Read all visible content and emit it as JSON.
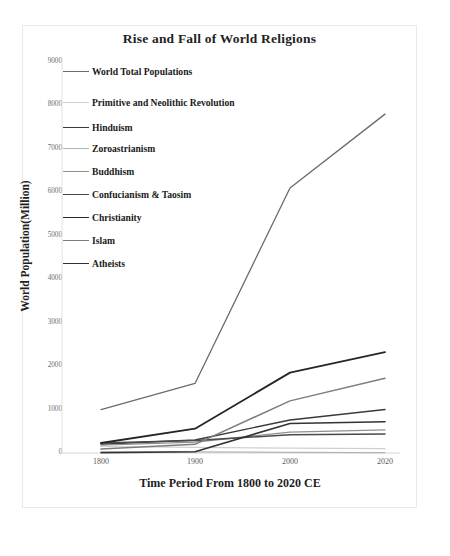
{
  "chart_data": {
    "type": "line",
    "title": "Rise and Fall of World Religions",
    "xlabel": "Time Period From 1800 to 2020 CE",
    "ylabel": "World Population(Million)",
    "categories": [
      "1800",
      "1900",
      "2000",
      "2020"
    ],
    "x": [
      1800,
      1900,
      2000,
      2020
    ],
    "xlim": [
      1790,
      2030
    ],
    "ylim": [
      0,
      9000
    ],
    "yticks": [
      0,
      1000,
      2000,
      3000,
      4000,
      5000,
      6000,
      7000,
      8000,
      9000
    ],
    "ytick_labels": [
      "0",
      "1000",
      "2000",
      "3000",
      "4000",
      "5000",
      "6000",
      "7000",
      "8000",
      "9000"
    ],
    "grid": false,
    "legend_position": "upper-left-inside",
    "series": [
      {
        "name": "World Total Populations",
        "color": "#6b6b6b",
        "width": 1.3,
        "values": [
          1000,
          1600,
          6100,
          7800
        ]
      },
      {
        "name": "Primitive and Neolithic Revolution",
        "color": "#d0d0d0",
        "width": 1.2,
        "values": [
          150,
          130,
          110,
          100
        ]
      },
      {
        "name": "Hinduism",
        "color": "#3a3a3a",
        "width": 1.4,
        "values": [
          200,
          300,
          760,
          1000
        ]
      },
      {
        "name": "Zoroastrianism",
        "color": "#b4b4b4",
        "width": 1.2,
        "values": [
          30,
          25,
          15,
          10
        ]
      },
      {
        "name": "Buddhism",
        "color": "#8f8f8f",
        "width": 1.3,
        "values": [
          180,
          250,
          480,
          530
        ]
      },
      {
        "name": "Confucianism & Taosim",
        "color": "#4a4a4a",
        "width": 1.5,
        "values": [
          230,
          290,
          420,
          440
        ]
      },
      {
        "name": "Christianity",
        "color": "#262626",
        "width": 1.8,
        "values": [
          230,
          560,
          1850,
          2320
        ]
      },
      {
        "name": "Islam",
        "color": "#7d7d7d",
        "width": 1.5,
        "values": [
          90,
          200,
          1200,
          1720
        ]
      },
      {
        "name": "Atheists",
        "color": "#333333",
        "width": 1.6,
        "values": [
          5,
          30,
          680,
          720
        ]
      }
    ]
  },
  "legend": {
    "items": [
      {
        "label": "World Total Populations"
      },
      {
        "label": "Primitive and Neolithic Revolution"
      },
      {
        "label": "Hinduism"
      },
      {
        "label": "Zoroastrianism"
      },
      {
        "label": "Buddhism"
      },
      {
        "label": "Confucianism & Taosim"
      },
      {
        "label": "Christianity"
      },
      {
        "label": "Islam"
      },
      {
        "label": "Atheists"
      }
    ]
  }
}
